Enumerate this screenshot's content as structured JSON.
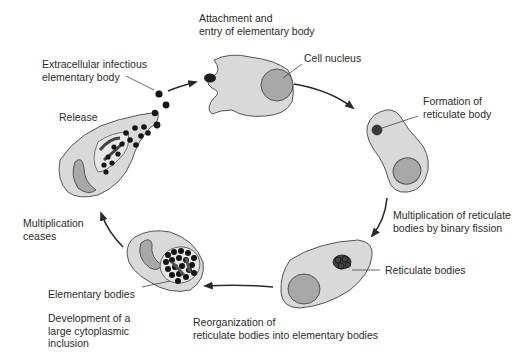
{
  "colors": {
    "cell_fill": "#d9d9d9",
    "cell_stroke": "#555555",
    "nucleus_fill": "#a8a8a8",
    "body_fill": "#1e1e1e",
    "arrow": "#2a2a2a",
    "text": "#2b2b2b"
  },
  "labels": {
    "attachment": "Attachment and\nentry of elementary body",
    "cell_nucleus": "Cell nucleus",
    "extracellular": "Extracellular infectious\nelementary body",
    "formation": "Formation of\nreticulate body",
    "release": "Release",
    "multiplication_reticulate": "Multiplication of reticulate\nbodies by binary fission",
    "multiplication_ceases": "Multiplication\nceases",
    "reticulate_bodies": "Reticulate bodies",
    "elementary_bodies": "Elementary bodies",
    "development": "Development of a\nlarge cytoplasmic\ninclusion",
    "reorganization": "Reorganization of\nreticulate bodies into elementary bodies"
  },
  "stages": [
    {
      "id": "attachment",
      "order": 1
    },
    {
      "id": "formation",
      "order": 2
    },
    {
      "id": "multiplication",
      "order": 3
    },
    {
      "id": "reorganization",
      "order": 4
    },
    {
      "id": "inclusion",
      "order": 5
    },
    {
      "id": "release",
      "order": 6
    }
  ]
}
